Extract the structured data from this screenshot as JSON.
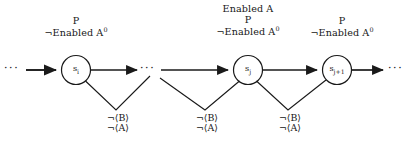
{
  "figure": {
    "type": "state-transition-diagram",
    "background": "#ffffff",
    "stroke_color": "#1a1a1a",
    "text_color": "#161616",
    "states": [
      {
        "id": "state-i",
        "base": "s",
        "subscript": "i",
        "label": "s i"
      },
      {
        "id": "state-j",
        "base": "s",
        "subscript": "j",
        "label": "s j"
      },
      {
        "id": "state-j1",
        "base": "s",
        "subscript": "j+1",
        "label": "s j+1"
      }
    ],
    "annotations_above": [
      {
        "id": "annotation-above-state-i",
        "lines": [
          "P",
          "¬Enabled A"
        ],
        "line1": "P",
        "line2_prefix": "¬Enabled A",
        "line2_superscript": "0",
        "line0": ""
      },
      {
        "id": "annotation-above-state-j",
        "lines": [
          "Enabled A",
          "P",
          "¬Enabled A"
        ],
        "line0": "Enabled A",
        "line1": "P",
        "line2_prefix": "¬Enabled A",
        "line2_superscript": "0"
      },
      {
        "id": "annotation-above-state-j1",
        "lines": [
          "P",
          "¬Enabled A"
        ],
        "line0": "",
        "line1": "P",
        "line2_prefix": "¬Enabled A",
        "line2_superscript": "0"
      }
    ],
    "annotations_below": [
      {
        "id": "guard-label-1",
        "line1": "¬⟨B⟩",
        "line2": "¬⟨A⟩"
      },
      {
        "id": "guard-label-2",
        "line1": "¬⟨B⟩",
        "line2": "¬⟨A⟩"
      },
      {
        "id": "guard-label-3",
        "line1": "¬⟨B⟩",
        "line2": "¬⟨A⟩"
      }
    ],
    "ellipses": [
      {
        "id": "ellipsis-left",
        "text": "···"
      },
      {
        "id": "ellipsis-middle",
        "text": "···"
      },
      {
        "id": "ellipsis-right",
        "text": "···"
      }
    ]
  }
}
